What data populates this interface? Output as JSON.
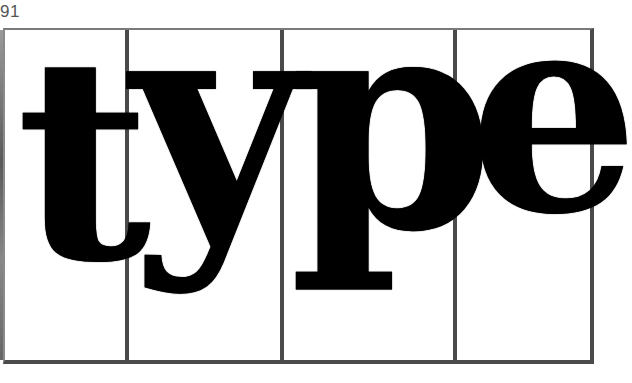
{
  "page": {
    "number": "91"
  },
  "artwork": {
    "word": "type",
    "letters": [
      {
        "char": "t",
        "panel": 1
      },
      {
        "char": "y",
        "panel": 2
      },
      {
        "char": "p",
        "panel": 3
      },
      {
        "char": "e",
        "panel": 4
      }
    ],
    "colors": {
      "ink": "#000000",
      "frame": "#4a4a4a",
      "background": "#ffffff"
    }
  }
}
